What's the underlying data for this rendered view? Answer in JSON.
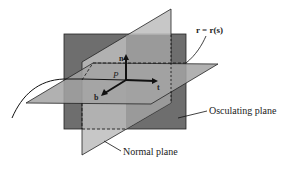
{
  "diagram": {
    "curve_label": "r = r(s)",
    "point_label": "P",
    "vectors": {
      "normal": "n",
      "tangent": "t",
      "binormal": "b"
    },
    "labels": {
      "osculating_plane": "Osculating plane",
      "normal_plane": "Normal plane"
    },
    "colors": {
      "osculating_plane": "#6e6e6e",
      "normal_plane": "#b9b9b9",
      "rectifying_plane": "#9a9a9a",
      "lines": "#1a1a1a"
    }
  }
}
